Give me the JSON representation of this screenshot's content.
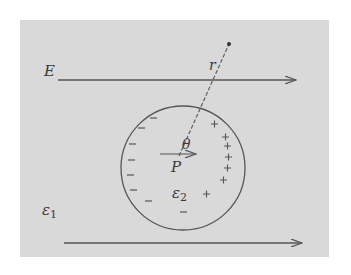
{
  "diagram": {
    "type": "physics-figure",
    "colors": {
      "background": "#ffffff",
      "panel": "#d9d9d9",
      "ink": "#4a4a4a"
    },
    "labels": {
      "field": "E",
      "radius": "r",
      "angle": "θ",
      "polarization": "P",
      "inner_permittivity": "ε",
      "inner_permittivity_sub": "2",
      "outer_permittivity": "ε",
      "outer_permittivity_sub": "1"
    },
    "charges": {
      "negative_symbol": "−",
      "positive_symbol": "+"
    }
  }
}
